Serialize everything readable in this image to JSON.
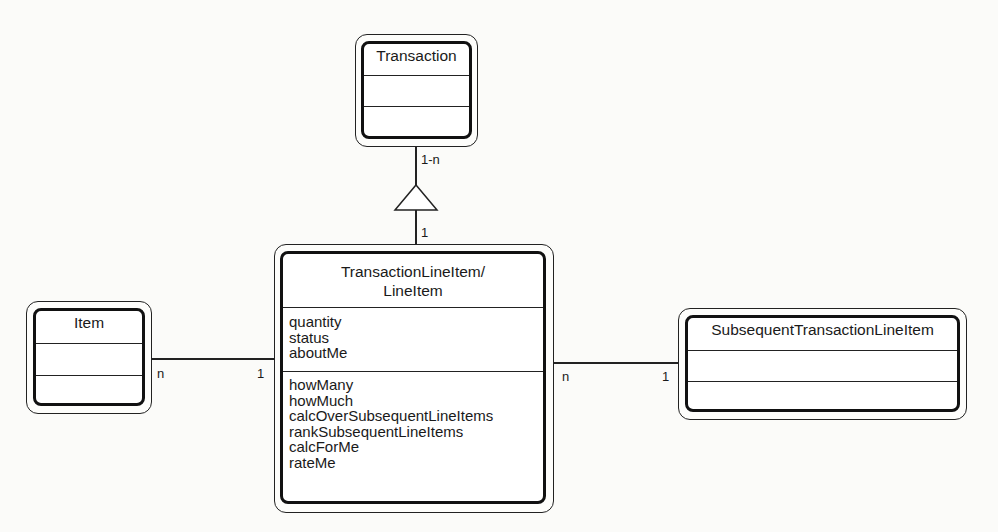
{
  "diagram": {
    "type": "UML class diagram",
    "classes": [
      {
        "name": "Transaction",
        "attributes": [],
        "methods": []
      },
      {
        "name": "TransactionLineItem/ LineItem",
        "title_lines": [
          "TransactionLineItem/",
          "LineItem"
        ],
        "attributes": [
          "quantity",
          "status",
          "aboutMe"
        ],
        "methods": [
          "howMany",
          "howMuch",
          "calcOverSubsequentLineItems",
          "rankSubsequentLineItems",
          "calcForMe",
          "rateMe"
        ]
      },
      {
        "name": "Item",
        "attributes": [],
        "methods": []
      },
      {
        "name": "SubsequentTransactionLineItem",
        "attributes": [],
        "methods": []
      }
    ],
    "relations": [
      {
        "from": "Transaction",
        "to": "TransactionLineItem",
        "kind": "aggregation-triangle",
        "from_mult": "1-n",
        "to_mult": "1"
      },
      {
        "from": "Item",
        "to": "TransactionLineItem",
        "from_mult": "n",
        "to_mult": "1"
      },
      {
        "from": "TransactionLineItem",
        "to": "SubsequentTransactionLineItem",
        "from_mult": "n",
        "to_mult": "1"
      }
    ]
  }
}
